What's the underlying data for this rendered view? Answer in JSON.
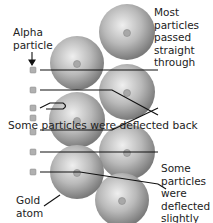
{
  "diagram": {
    "type": "rutherford-gold-foil-experiment",
    "colors": {
      "sphere_light": "#eeeeee",
      "sphere_mid": "#b3b3b3",
      "sphere_dark": "#7d7d7d",
      "line": "#111111",
      "text": "#222222",
      "particle": "#9a9a9a"
    },
    "labels": {
      "alpha_particle": [
        "Alpha",
        "particle"
      ],
      "most_passed": [
        "Most",
        "particles",
        "passed",
        "straight",
        "through"
      ],
      "deflected_back": "Some particles were deflected back",
      "deflected_slightly": [
        "Some",
        "particles",
        "were",
        "deflected",
        "slightly"
      ],
      "gold_atom": [
        "Gold",
        "atom"
      ]
    },
    "gold_atoms": [
      {
        "cx": 127,
        "cy": 32,
        "r": 28
      },
      {
        "cx": 127,
        "cy": 92,
        "r": 28
      },
      {
        "cx": 77,
        "cy": 65,
        "r": 28
      },
      {
        "cx": 77,
        "cy": 122,
        "r": 28
      },
      {
        "cx": 127,
        "cy": 152,
        "r": 28
      },
      {
        "cx": 77,
        "cy": 172,
        "r": 28
      },
      {
        "cx": 122,
        "cy": 202,
        "r": 28
      }
    ],
    "alpha_particles": [
      {
        "x": 33,
        "y": 70
      },
      {
        "x": 33,
        "y": 90
      },
      {
        "x": 33,
        "y": 108
      },
      {
        "x": 33,
        "y": 118
      },
      {
        "x": 33,
        "y": 132
      },
      {
        "x": 33,
        "y": 152
      },
      {
        "x": 33,
        "y": 172
      }
    ]
  }
}
